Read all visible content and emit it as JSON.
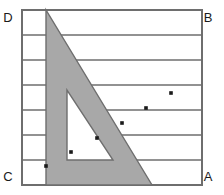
{
  "figure": {
    "background_color": "#ffffff",
    "line_color": "#6e6e6e",
    "shade_color": "#a8a8a8",
    "dot_color": "#1a1a1a",
    "label_color": "#1a1a1a"
  },
  "rectangle": {
    "name": "rectangle-ABCD",
    "x": 22,
    "y": 10,
    "width": 180,
    "height": 175,
    "stroke_width": 2
  },
  "corner_labels": [
    {
      "id": "D",
      "text": "D",
      "x": 8,
      "y": 22
    },
    {
      "id": "B",
      "text": "B",
      "x": 208,
      "y": 22
    },
    {
      "id": "C",
      "text": "C",
      "x": 8,
      "y": 181
    },
    {
      "id": "A",
      "text": "A",
      "x": 208,
      "y": 181
    }
  ],
  "ruled_lines": {
    "name": "horizontal-rule-lines",
    "count": 6,
    "spacing": 25,
    "y_values": [
      35,
      60,
      85,
      110,
      135,
      160
    ],
    "x_start": 22,
    "x_end": 202,
    "stroke_width": 1.6
  },
  "set_square": {
    "name": "set-square-outer-triangle",
    "points": "46,10 46,185 152,185",
    "fill": "#a8a8a8",
    "stroke": "#6e6e6e",
    "stroke_width": 1.4
  },
  "set_square_hole": {
    "name": "set-square-inner-cutout",
    "points": "67,90 67,160 113,160",
    "fill": "#ffffff",
    "stroke": "#6e6e6e",
    "stroke_width": 1.4
  },
  "dots": [
    {
      "id": "dot-1",
      "x": 171,
      "y": 93,
      "r": 1.8
    },
    {
      "id": "dot-2",
      "x": 146,
      "y": 108,
      "r": 1.8
    },
    {
      "id": "dot-3",
      "x": 122,
      "y": 123,
      "r": 1.8
    },
    {
      "id": "dot-4",
      "x": 97,
      "y": 138,
      "r": 1.8
    },
    {
      "id": "dot-5",
      "x": 71,
      "y": 152,
      "r": 1.8
    },
    {
      "id": "dot-6",
      "x": 46,
      "y": 166,
      "r": 1.8
    }
  ]
}
